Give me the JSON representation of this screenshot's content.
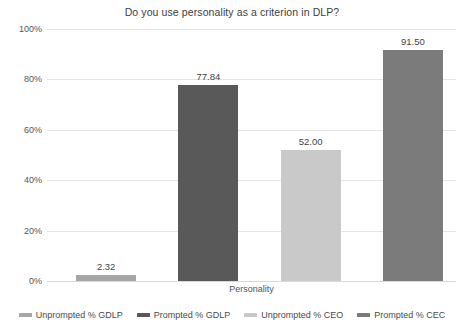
{
  "chart_data": {
    "type": "bar",
    "title": "Do you use personality as a criterion in DLP?",
    "xlabel": "Personality",
    "ylabel": "",
    "categories": [
      "Personality"
    ],
    "ytick_labels": [
      "0%",
      "20%",
      "40%",
      "60%",
      "80%",
      "100%"
    ],
    "ytick_values": [
      0,
      20,
      40,
      60,
      80,
      100
    ],
    "ylim": [
      0,
      100
    ],
    "grid": true,
    "legend_position": "bottom",
    "series": [
      {
        "name": "Unprompted % GDLP",
        "values": [
          2.32
        ],
        "label": "2.32",
        "color": "#A6A6A6"
      },
      {
        "name": "Prompted % GDLP",
        "values": [
          77.84
        ],
        "label": "77.84",
        "color": "#595959"
      },
      {
        "name": "Unprompted % CEO",
        "values": [
          52.0
        ],
        "label": "52.00",
        "color": "#C9C9C9"
      },
      {
        "name": "Prompted % CEC",
        "values": [
          91.5
        ],
        "label": "91.50",
        "color": "#7B7B7B"
      }
    ]
  }
}
